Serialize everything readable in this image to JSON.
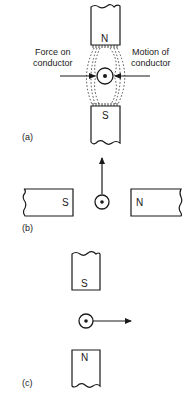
{
  "figure": {
    "panels": [
      {
        "id": "a",
        "label": "(a)",
        "magnets": [
          {
            "pole": "N",
            "position": "top"
          },
          {
            "pole": "S",
            "position": "bottom"
          }
        ],
        "conductor": {
          "current_direction": "out-of-page (dot)"
        },
        "annotations": {
          "left_line1": "Force on",
          "left_line2": "conductor",
          "right_line1": "Motion of",
          "right_line2": "conductor"
        },
        "field_lines": "distorted field between poles"
      },
      {
        "id": "b",
        "label": "(b)",
        "magnets": [
          {
            "pole": "S",
            "position": "left"
          },
          {
            "pole": "N",
            "position": "right"
          }
        ],
        "conductor": {
          "current_direction": "out-of-page (dot)"
        },
        "force_arrow": "up"
      },
      {
        "id": "c",
        "label": "(c)",
        "magnets": [
          {
            "pole": "S",
            "position": "top"
          },
          {
            "pole": "N",
            "position": "bottom"
          }
        ],
        "conductor": {
          "current_direction": "out-of-page (dot)"
        },
        "force_arrow": "right"
      }
    ]
  }
}
